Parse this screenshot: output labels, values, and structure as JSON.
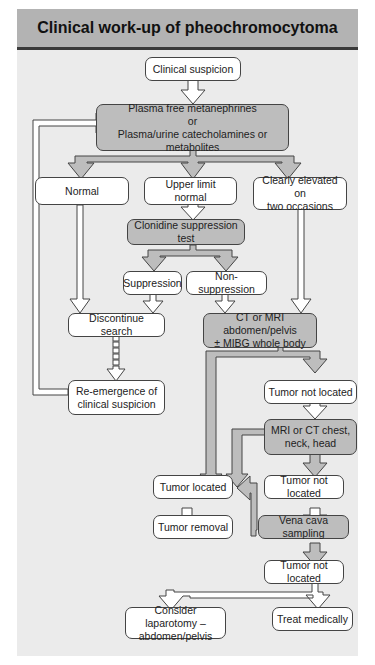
{
  "title": "Clinical work-up of pheochromocytoma",
  "colors": {
    "header": "#b3b3b3",
    "background": "#ebebeb",
    "box": "#ffffff",
    "shaded_box": "#bdbdbd",
    "border": "#444444"
  },
  "nodes": {
    "clinical_suspicion": {
      "lines": [
        "Clinical suspicion"
      ]
    },
    "plasma_tests": {
      "lines": [
        "Plasma free metanephrines",
        "or",
        "Plasma/urine catecholamines or metabolites"
      ]
    },
    "normal": {
      "lines": [
        "Normal"
      ]
    },
    "upper_limit_normal": {
      "lines": [
        "Upper limit normal"
      ]
    },
    "clearly_elevated": {
      "lines": [
        "Clearly elevated on",
        "two occasions"
      ]
    },
    "clonidine_test": {
      "lines": [
        "Clonidine suppression test"
      ]
    },
    "suppression": {
      "lines": [
        "Suppression"
      ]
    },
    "non_suppression": {
      "lines": [
        "Non-suppression"
      ]
    },
    "discontinue_search": {
      "lines": [
        "Discontinue search"
      ]
    },
    "ct_mri_abdomen": {
      "lines": [
        "CT or MRI abdomen/pelvis",
        "± MIBG whole body"
      ]
    },
    "re_emergence": {
      "lines": [
        "Re-emergence of",
        "clinical suspicion"
      ]
    },
    "tumor_not_located_1": {
      "lines": [
        "Tumor not located"
      ]
    },
    "mri_ct_chest": {
      "lines": [
        "MRI or CT chest,",
        "neck, head"
      ]
    },
    "tumor_located": {
      "lines": [
        "Tumor located"
      ]
    },
    "tumor_not_located_2": {
      "lines": [
        "Tumor not located"
      ]
    },
    "tumor_removal": {
      "lines": [
        "Tumor removal"
      ]
    },
    "vena_cava_sampling": {
      "lines": [
        "Vena cava sampling"
      ]
    },
    "tumor_not_located_3": {
      "lines": [
        "Tumor not located"
      ]
    },
    "consider_laparotomy": {
      "lines": [
        "Consider laparotomy –",
        "abdomen/pelvis"
      ]
    },
    "treat_medically": {
      "lines": [
        "Treat medically"
      ]
    }
  }
}
